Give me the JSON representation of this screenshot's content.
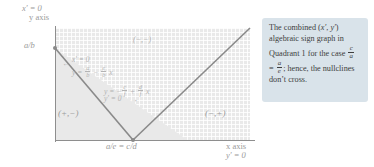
{
  "figure": {
    "axes": {
      "y_axis_top_label_line1": "x′ = 0",
      "y_axis_top_label_line2": "y axis",
      "y_intercept_tick": "a/b",
      "x_axis_label_line1": "x axis",
      "x_axis_label_line2": "y′ = 0",
      "vertex_label": "a/e = c/d"
    },
    "regions": [
      {
        "name": "upper-wedge",
        "sign": "(−,−)"
      },
      {
        "name": "left-wedge",
        "sign": "(+,−)"
      },
      {
        "name": "right-wedge",
        "sign": "(−,+)"
      }
    ],
    "annotations": {
      "nullcline1_line1": "x′ = 0",
      "nullcline1_line2_prefix": "y = ",
      "nullcline1_num1": "a",
      "nullcline1_den1": "b",
      "nullcline1_minus": " − ",
      "nullcline1_num2": "e",
      "nullcline1_den2": "b",
      "nullcline1_suffix": " x",
      "nullcline2_line1_prefix": "y = −",
      "nullcline2_num1": "c",
      "nullcline2_den1": "f",
      "nullcline2_plus": " + ",
      "nullcline2_num2": "d",
      "nullcline2_den2": "f",
      "nullcline2_suffix": " x",
      "nullcline2_line2": "y′ = 0",
      "arrow_left": "←",
      "arrow_right": "→"
    }
  },
  "callout": {
    "text_part1": "The combined (",
    "text_xprime": "x′",
    "text_comma": ", ",
    "text_yprime": "y′",
    "text_part2": ") algebraic sign graph in Quadrant 1 for the case ",
    "frac1_num": "c",
    "frac1_den": "a",
    "text_equals": " = ",
    "frac2_num": "a",
    "frac2_den": "e",
    "text_part3": "; hence, the nullclines don’t cross."
  },
  "colors": {
    "callout_bg": "#d9e3ea",
    "plot_bg": "#e9e9e9",
    "axis": "#8e8e8e",
    "line": "#8a8a8a",
    "text": "#6f6f6f"
  }
}
